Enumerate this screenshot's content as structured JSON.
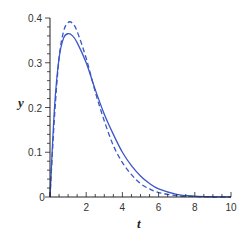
{
  "chart_data": {
    "type": "line",
    "title": "",
    "xlabel": "t",
    "ylabel": "y",
    "xlim": [
      0,
      10
    ],
    "ylim": [
      0,
      0.4
    ],
    "grid": false,
    "legend": null,
    "x_ticks": [
      "0",
      "2",
      "4",
      "6",
      "8",
      "10"
    ],
    "y_ticks": [
      "0.1",
      "0.2",
      "0.3",
      "0.4"
    ],
    "origin_label": "0",
    "line_color": "#3a56c8",
    "series": [
      {
        "name": "solid",
        "style": "solid",
        "x": [
          0,
          0.25,
          0.5,
          0.75,
          1.0,
          1.25,
          1.5,
          2,
          2.5,
          3,
          3.5,
          4,
          4.5,
          5,
          5.5,
          6,
          7,
          8,
          9,
          10
        ],
        "values": [
          0,
          0.2,
          0.31,
          0.355,
          0.365,
          0.36,
          0.345,
          0.3,
          0.24,
          0.185,
          0.14,
          0.1,
          0.07,
          0.047,
          0.03,
          0.018,
          0.006,
          0.002,
          0.0005,
          0
        ]
      },
      {
        "name": "dashed",
        "style": "dashed",
        "x": [
          0,
          0.25,
          0.5,
          0.75,
          1.0,
          1.25,
          1.5,
          2,
          2.5,
          3,
          3.5,
          4,
          4.5,
          5,
          5.5,
          6,
          7,
          8,
          9,
          10
        ],
        "values": [
          0,
          0.18,
          0.31,
          0.37,
          0.39,
          0.388,
          0.37,
          0.31,
          0.235,
          0.17,
          0.115,
          0.077,
          0.05,
          0.03,
          0.018,
          0.01,
          0.003,
          0.001,
          0,
          0
        ]
      }
    ]
  }
}
